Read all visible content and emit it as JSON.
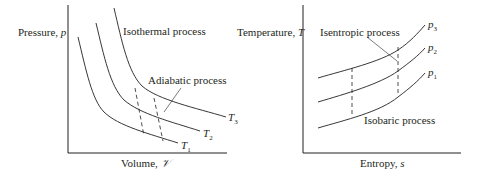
{
  "left_diagram": {
    "title": "p-V diagram",
    "y_axis_label": "Pressure, ",
    "y_axis_symbol": "p",
    "x_axis_label": "Volume, ",
    "x_axis_symbol": "𝒱",
    "annotations": {
      "isothermal": "Isothermal process",
      "adiabatic": "Adiabatic process"
    },
    "curve_labels": [
      {
        "symbol": "T",
        "sub": "1"
      },
      {
        "symbol": "T",
        "sub": "2"
      },
      {
        "symbol": "T",
        "sub": "3"
      }
    ]
  },
  "right_diagram": {
    "title": "T-s diagram",
    "y_axis_label": "Temperature, ",
    "y_axis_symbol": "T",
    "x_axis_label": "Entropy, ",
    "x_axis_symbol": "s",
    "annotations": {
      "isentropic": "Isentropic process",
      "isobaric": "Isobaric process"
    },
    "curve_labels": [
      {
        "symbol": "p",
        "sub": "1"
      },
      {
        "symbol": "p",
        "sub": "2"
      },
      {
        "symbol": "p",
        "sub": "3"
      }
    ]
  }
}
